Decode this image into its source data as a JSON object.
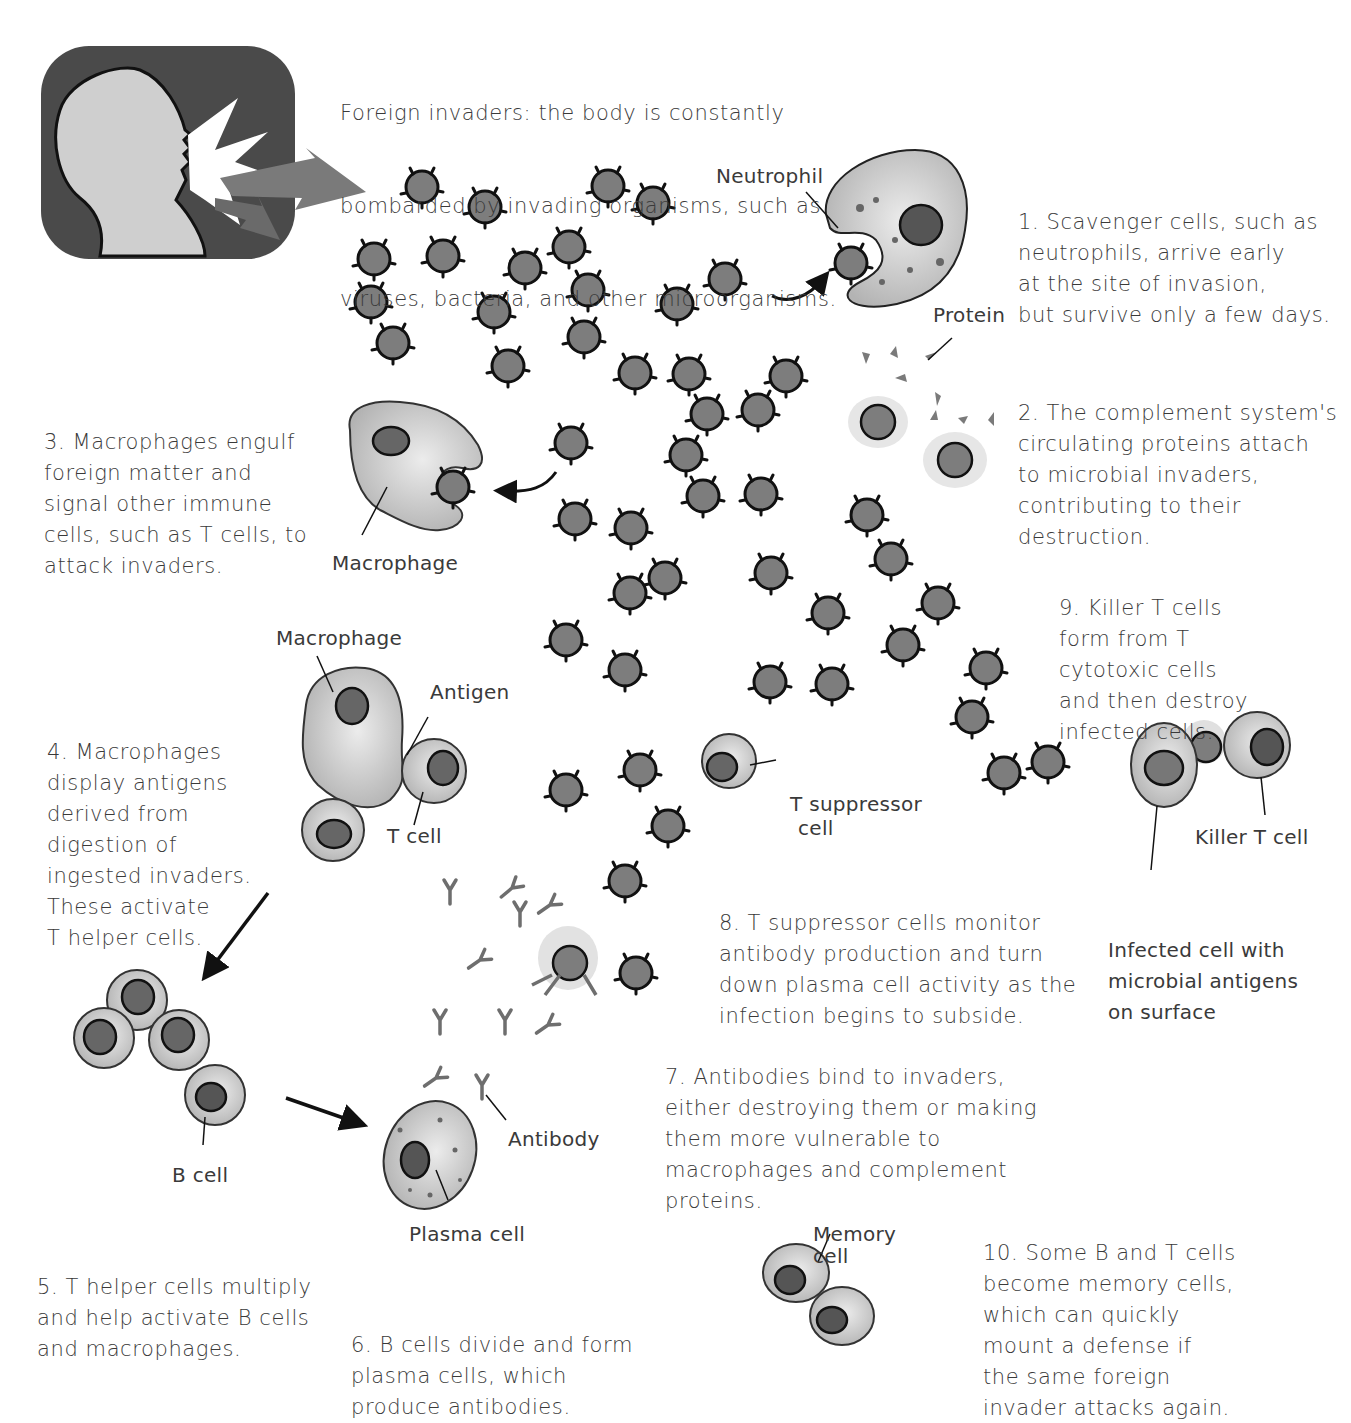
{
  "intro": {
    "lines": [
      "Foreign invaders: the body is constantly",
      "bombarded by invading organisms, such as",
      "viruses, bacteria, and other microorganisms."
    ]
  },
  "steps": [
    {
      "id": 1,
      "lines": [
        "1. Scavenger cells, such as",
        "neutrophils, arrive early",
        "at the site of invasion,",
        "but survive only a few days."
      ]
    },
    {
      "id": 2,
      "lines": [
        "2. The complement system's",
        "circulating proteins attach",
        "to microbial invaders,",
        "contributing to their",
        "destruction."
      ]
    },
    {
      "id": 3,
      "lines": [
        "3. Macrophages engulf",
        "foreign matter and",
        "signal other immune",
        "cells, such as T cells, to",
        "attack invaders."
      ]
    },
    {
      "id": 4,
      "lines": [
        "4. Macrophages",
        "display antigens",
        "derived from",
        "digestion of",
        "ingested invaders.",
        "These activate",
        "T helper cells."
      ]
    },
    {
      "id": 5,
      "lines": [
        "5. T helper cells multiply",
        "and help activate B cells",
        "and macrophages."
      ]
    },
    {
      "id": 6,
      "lines": [
        "6. B cells divide and form",
        "plasma cells, which",
        "produce antibodies."
      ]
    },
    {
      "id": 7,
      "lines": [
        "7. Antibodies bind to invaders,",
        "either destroying them or making",
        "them more vulnerable to",
        "macrophages and complement",
        "proteins."
      ]
    },
    {
      "id": 8,
      "lines": [
        "8. T suppressor cells monitor",
        "antibody production and turn",
        "down plasma cell activity as the",
        "infection begins to subside."
      ]
    },
    {
      "id": 9,
      "lines": [
        "9. Killer T cells",
        "form from T",
        "cytotoxic cells",
        "and then destroy",
        "infected cells."
      ]
    },
    {
      "id": 10,
      "lines": [
        "10. Some B and T cells",
        "become memory cells,",
        "which can quickly",
        "mount a defense if",
        "the same foreign",
        "invader attacks again."
      ]
    }
  ],
  "labels": {
    "neutrophil": "Neutrophil",
    "protein": "Protein",
    "macrophage_1": "Macrophage",
    "macrophage_2": "Macrophage",
    "antigen": "Antigen",
    "t_cell": "T cell",
    "b_cell": "B cell",
    "plasma_cell": "Plasma cell",
    "antibody": "Antibody",
    "t_suppressor": [
      "T suppressor",
      "cell"
    ],
    "killer_t": "Killer T cell",
    "infected_cell": [
      "Infected cell with",
      "microbial antigens",
      "on surface"
    ],
    "memory_cell": [
      "Memory",
      "cell"
    ]
  },
  "colors": {
    "invader_fill": "#7d7d7d",
    "cell_fill": "#c9c9c9",
    "nucleus_fill": "#6a6a6a",
    "outline": "#111111",
    "panel_bg": "#4a4a4a",
    "silhouette": "#cfcfcf",
    "arrow_gray": "#7a7a7a"
  }
}
